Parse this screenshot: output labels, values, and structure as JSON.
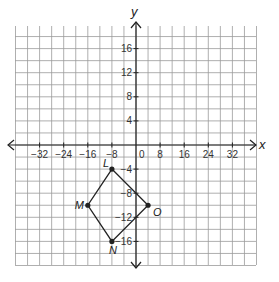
{
  "axes": {
    "x_label": "x",
    "y_label": "y",
    "x_ticks": [
      {
        "value": -32,
        "label": "−32"
      },
      {
        "value": -24,
        "label": "−24"
      },
      {
        "value": -16,
        "label": "−16"
      },
      {
        "value": -8,
        "label": "−8"
      },
      {
        "value": 0,
        "label": "0"
      },
      {
        "value": 8,
        "label": "8"
      },
      {
        "value": 16,
        "label": "16"
      },
      {
        "value": 24,
        "label": "24"
      },
      {
        "value": 32,
        "label": "32"
      }
    ],
    "y_ticks": [
      {
        "value": 16,
        "label": "16"
      },
      {
        "value": 12,
        "label": "12"
      },
      {
        "value": 8,
        "label": "8"
      },
      {
        "value": 4,
        "label": "4"
      },
      {
        "value": -4,
        "label": "−4"
      },
      {
        "value": -8,
        "label": "−8"
      },
      {
        "value": -12,
        "label": "−12"
      },
      {
        "value": -16,
        "label": "−16"
      }
    ],
    "x_units_per_cell": 4,
    "y_units_per_cell": 2
  },
  "polygon": {
    "name": "LMNO",
    "vertices": [
      {
        "label": "L",
        "x": -8,
        "y": -4
      },
      {
        "label": "M",
        "x": -16,
        "y": -10
      },
      {
        "label": "N",
        "x": -8,
        "y": -16
      },
      {
        "label": "O",
        "x": 4,
        "y": -10
      }
    ]
  },
  "colors": {
    "grid": "#9a9a9a",
    "axis": "#222222",
    "shape": "#222222"
  }
}
